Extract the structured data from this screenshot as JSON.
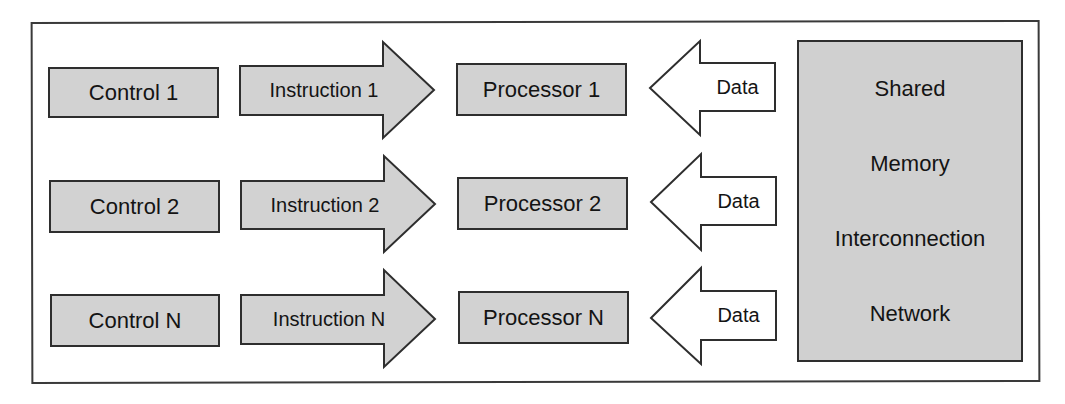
{
  "diagram": {
    "type": "MIMD shared memory architecture",
    "rows": [
      {
        "control": "Control 1",
        "instruction": "Instruction 1",
        "processor": "Processor 1",
        "data": "Data"
      },
      {
        "control": "Control 2",
        "instruction": "Instruction 2",
        "processor": "Processor 2",
        "data": "Data"
      },
      {
        "control": "Control N",
        "instruction": "Instruction N",
        "processor": "Processor N",
        "data": "Data"
      }
    ],
    "shared_memory": {
      "lines": [
        "Shared",
        "Memory",
        "Interconnection",
        "Network"
      ]
    },
    "colors": {
      "box_fill": "#d2d2d2",
      "border": "#2e2e2e",
      "data_arrow_fill": "#ffffff",
      "text": "#141414"
    }
  }
}
